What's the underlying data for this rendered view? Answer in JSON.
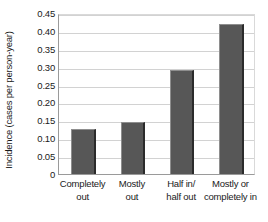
{
  "chart_data": {
    "type": "bar",
    "title": "",
    "xlabel": "",
    "ylabel": "Incidence (cases per person-year)",
    "categories": [
      "Completely out",
      "Mostly out",
      "Half in/ half out",
      "Mostly or completely in"
    ],
    "category_lines": [
      [
        "Completely",
        "out"
      ],
      [
        "Mostly",
        "out"
      ],
      [
        "Half in/",
        "half out"
      ],
      [
        "Mostly or",
        "completely in"
      ]
    ],
    "values": [
      0.125,
      0.145,
      0.29,
      0.42
    ],
    "ylim": [
      0,
      0.45
    ],
    "ytick_labels": [
      "0.45",
      "0.40",
      "0.35",
      "0.30",
      "0.25",
      "0.20",
      "0.15",
      "0.10",
      "0.05",
      "0"
    ],
    "ytick_values": [
      0.45,
      0.4,
      0.35,
      0.3,
      0.25,
      0.2,
      0.15,
      0.1,
      0.05,
      0
    ],
    "grid": "horizontal",
    "legend": "none",
    "bar_color": "#575757",
    "grid_color": "#d2d2d2",
    "axis_color": "#9a9a9a"
  }
}
